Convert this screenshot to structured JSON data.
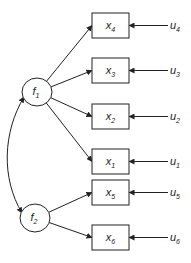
{
  "factors": [
    {
      "id": "f1",
      "base": "f",
      "sub": "1",
      "cx": 37,
      "cy": 92
    },
    {
      "id": "f2",
      "base": "f",
      "sub": "2",
      "cx": 35,
      "cy": 218
    }
  ],
  "indicators": [
    {
      "id": "x4",
      "base": "x",
      "sub": "4",
      "y": 13,
      "factor": "f1",
      "error": {
        "base": "u",
        "sub": "4"
      }
    },
    {
      "id": "x3",
      "base": "x",
      "sub": "3",
      "y": 58,
      "factor": "f1",
      "error": {
        "base": "u",
        "sub": "3"
      }
    },
    {
      "id": "x2",
      "base": "x",
      "sub": "2",
      "y": 104,
      "factor": "f1",
      "error": {
        "base": "u",
        "sub": "2"
      }
    },
    {
      "id": "x1",
      "base": "x",
      "sub": "1",
      "y": 149,
      "factor": "f1",
      "error": {
        "base": "u",
        "sub": "1"
      }
    },
    {
      "id": "x5",
      "base": "x",
      "sub": "5",
      "y": 180,
      "factor": "f2",
      "error": {
        "base": "u",
        "sub": "5"
      }
    },
    {
      "id": "x6",
      "base": "x",
      "sub": "6",
      "y": 225,
      "factor": "f2",
      "error": {
        "base": "u",
        "sub": "6"
      }
    }
  ],
  "covariance": {
    "from": "f1",
    "to": "f2"
  },
  "colors": {
    "stroke": "#222222",
    "background": "#ffffff"
  }
}
